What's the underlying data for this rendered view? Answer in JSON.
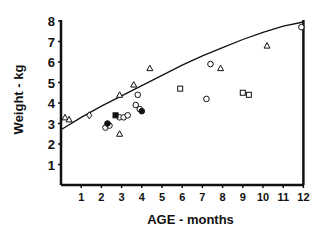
{
  "chart_data": {
    "type": "scatter",
    "title": "",
    "xlabel": "AGE - months",
    "ylabel": "Weight - kg",
    "xlim": [
      0,
      12
    ],
    "ylim": [
      0,
      8
    ],
    "xticks": [
      1,
      2,
      3,
      4,
      5,
      6,
      7,
      8,
      9,
      10,
      11,
      12
    ],
    "yticks": [
      1,
      2,
      3,
      4,
      5,
      6,
      7,
      8
    ],
    "grid": false,
    "legend": null,
    "reference_curve": {
      "name": "reference growth curve",
      "x": [
        0,
        1,
        2,
        3,
        4,
        5,
        6,
        7,
        8,
        9,
        10,
        11,
        12
      ],
      "y": [
        2.7,
        3.3,
        3.85,
        4.35,
        4.85,
        5.35,
        5.85,
        6.3,
        6.7,
        7.1,
        7.45,
        7.75,
        7.95
      ]
    },
    "series": [
      {
        "name": "triangles",
        "marker": "triangle",
        "points": [
          [
            0.2,
            3.3
          ],
          [
            0.4,
            3.2
          ],
          [
            2.9,
            2.5
          ],
          [
            2.9,
            4.4
          ],
          [
            3.6,
            4.9
          ],
          [
            4.4,
            5.7
          ],
          [
            7.9,
            5.7
          ],
          [
            10.2,
            6.8
          ]
        ]
      },
      {
        "name": "diamonds",
        "marker": "diamond",
        "points": [
          [
            1.4,
            3.4
          ]
        ]
      },
      {
        "name": "circles",
        "marker": "circle",
        "points": [
          [
            2.2,
            2.8
          ],
          [
            2.4,
            2.9
          ],
          [
            2.9,
            3.3
          ],
          [
            3.1,
            3.3
          ],
          [
            3.3,
            3.4
          ],
          [
            3.7,
            3.9
          ],
          [
            3.8,
            4.4
          ],
          [
            3.9,
            3.7
          ],
          [
            7.2,
            4.2
          ],
          [
            7.4,
            5.9
          ],
          [
            11.9,
            7.7
          ]
        ]
      },
      {
        "name": "filled circles",
        "marker": "filled-circle",
        "points": [
          [
            2.3,
            3.0
          ],
          [
            4.0,
            3.6
          ]
        ]
      },
      {
        "name": "filled squares",
        "marker": "filled-square",
        "points": [
          [
            2.7,
            3.4
          ]
        ]
      },
      {
        "name": "squares",
        "marker": "square",
        "points": [
          [
            5.9,
            4.7
          ],
          [
            9.0,
            4.5
          ],
          [
            9.3,
            4.4
          ]
        ]
      }
    ]
  }
}
